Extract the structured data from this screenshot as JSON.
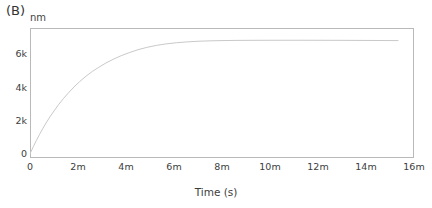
{
  "panel": {
    "label": "(B)",
    "unit": "nm"
  },
  "axes": {
    "x_title": "Time (s)",
    "x_ticklabels": [
      "0",
      "2m",
      "4m",
      "6m",
      "8m",
      "10m",
      "12m",
      "14m",
      "16m"
    ],
    "x_tickvalues": [
      0,
      120,
      240,
      360,
      480,
      600,
      720,
      840,
      960
    ],
    "y_ticklabels": [
      "0",
      "2k",
      "4k",
      "6k"
    ],
    "y_tickvalues": [
      0,
      2000,
      4000,
      6000
    ]
  },
  "style": {
    "curve_color": "#c9c9c9",
    "frame_color": "#b9b9b9",
    "text_color": "#3d3d3d",
    "background": "#ffffff",
    "curve_width": 1
  },
  "chart_data": {
    "type": "line",
    "title": "(B)",
    "xlabel": "Time (s)",
    "ylabel": "nm",
    "xlim": [
      0,
      960
    ],
    "ylim": [
      -250,
      7600
    ],
    "grid": false,
    "legend": null,
    "series": [
      {
        "name": "binding response",
        "color": "#c9c9c9",
        "x": [
          0,
          8,
          16,
          24,
          32,
          40,
          50,
          60,
          72,
          84,
          96,
          110,
          124,
          140,
          156,
          172,
          190,
          208,
          228,
          248,
          270,
          292,
          316,
          340,
          366,
          392,
          420,
          450,
          480,
          515,
          550,
          590,
          630,
          675,
          720,
          770,
          820,
          870,
          920
        ],
        "y": [
          0,
          420,
          810,
          1180,
          1530,
          1860,
          2240,
          2590,
          2990,
          3350,
          3680,
          4040,
          4360,
          4690,
          4980,
          5230,
          5490,
          5710,
          5930,
          6110,
          6290,
          6430,
          6550,
          6640,
          6710,
          6760,
          6800,
          6825,
          6840,
          6850,
          6855,
          6858,
          6860,
          6860,
          6858,
          6855,
          6850,
          6845,
          6840
        ]
      }
    ]
  }
}
